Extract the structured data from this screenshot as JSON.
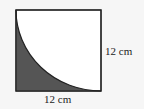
{
  "figure": {
    "shape": "square with quarter-circle arc",
    "side_label_right": "12 cm",
    "side_label_bottom": "12 cm",
    "colors": {
      "shaded": "#555555",
      "stroke": "#222222",
      "background": "#ffffff"
    }
  }
}
